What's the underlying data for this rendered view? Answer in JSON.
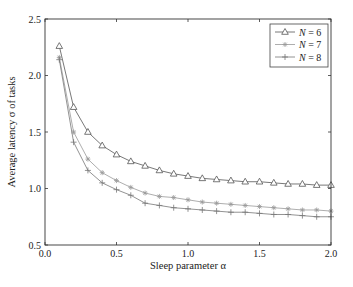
{
  "chart_data": {
    "type": "line",
    "title": "",
    "xlabel": "Sleep parameter α",
    "ylabel": "Average latency σ of tasks",
    "xlim": [
      0.0,
      2.0
    ],
    "ylim": [
      0.5,
      2.5
    ],
    "xticks": [
      "0.0",
      "0.5",
      "1.0",
      "1.5",
      "2.0"
    ],
    "yticks": [
      "0.5",
      "1.0",
      "1.5",
      "2.0",
      "2.5"
    ],
    "grid": false,
    "legend_position": "upper right",
    "x": [
      0.1,
      0.2,
      0.3,
      0.4,
      0.5,
      0.6,
      0.7,
      0.8,
      0.9,
      1.0,
      1.1,
      1.2,
      1.3,
      1.4,
      1.5,
      1.6,
      1.7,
      1.8,
      1.9,
      2.0
    ],
    "series": [
      {
        "name": "N = 6",
        "marker": "triangle",
        "values": [
          2.26,
          1.72,
          1.5,
          1.38,
          1.3,
          1.24,
          1.2,
          1.16,
          1.13,
          1.11,
          1.09,
          1.08,
          1.07,
          1.06,
          1.06,
          1.05,
          1.04,
          1.04,
          1.03,
          1.03
        ]
      },
      {
        "name": "N = 7",
        "marker": "asterisk",
        "values": [
          2.16,
          1.5,
          1.26,
          1.14,
          1.07,
          1.01,
          0.96,
          0.93,
          0.92,
          0.9,
          0.88,
          0.87,
          0.86,
          0.85,
          0.84,
          0.83,
          0.82,
          0.81,
          0.81,
          0.8
        ]
      },
      {
        "name": "N = 8",
        "marker": "plus",
        "values": [
          2.14,
          1.41,
          1.16,
          1.05,
          0.99,
          0.94,
          0.87,
          0.85,
          0.83,
          0.82,
          0.81,
          0.8,
          0.79,
          0.79,
          0.78,
          0.77,
          0.77,
          0.76,
          0.75,
          0.75
        ]
      }
    ]
  },
  "legend": [
    {
      "prefix": "N",
      "suffix": " = 6"
    },
    {
      "prefix": "N",
      "suffix": " = 7"
    },
    {
      "prefix": "N",
      "suffix": " = 8"
    }
  ]
}
